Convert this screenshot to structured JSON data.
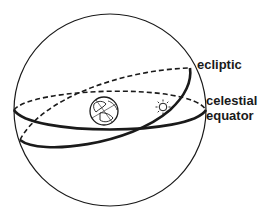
{
  "diagram": {
    "labels": {
      "ecliptic": "ecliptic",
      "celestial_equator_line1": "celestial",
      "celestial_equator_line2": "equator"
    },
    "elements": {
      "sphere": "celestial-sphere",
      "earth": "earth-icon",
      "sun": "sun-icon"
    },
    "colors": {
      "stroke": "#1a1a1a",
      "background": "#ffffff"
    }
  }
}
